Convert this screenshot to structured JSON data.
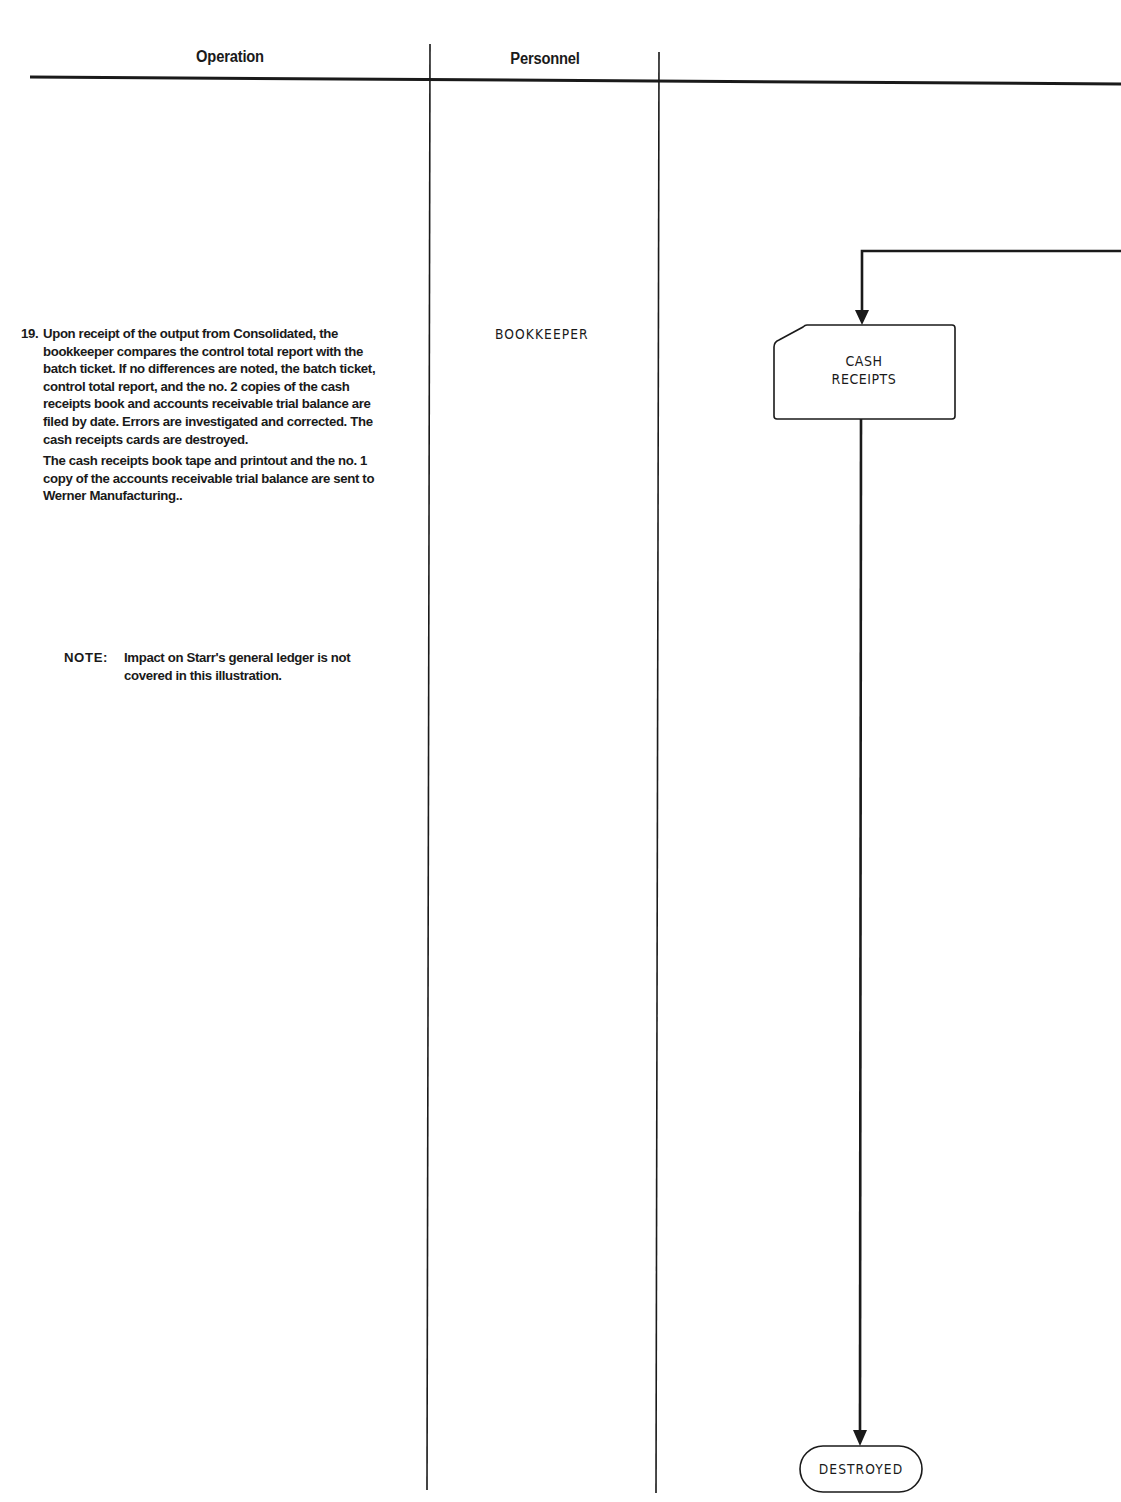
{
  "table": {
    "columns": [
      {
        "label": "Operation"
      },
      {
        "label": "Personnel"
      },
      {
        "label": ""
      }
    ]
  },
  "operation": {
    "step_number": "19.",
    "paragraphs": [
      "Upon receipt of the output from Consolidated, the bookkeeper compares the control total report with the batch ticket. If no differences are noted, the batch ticket, control total report, and the no. 2 copies of the cash receipts book and accounts receivable trial balance are filed by date.  Errors are investigated and corrected.  The cash receipts cards are destroyed.",
      "The cash receipts book tape and printout and the no. 1 copy of the accounts receivable trial balance are sent to Werner Manufacturing.."
    ],
    "note": {
      "label": "NOTE:",
      "text": "Impact on Starr's general ledger is not covered in this illustration."
    }
  },
  "personnel": {
    "role": "BOOKKEEPER"
  },
  "flowchart": {
    "nodes": [
      {
        "id": "cash-receipts",
        "shape": "punched-card",
        "label_line1": "CASH",
        "label_line2": "RECEIPTS"
      },
      {
        "id": "destroyed",
        "shape": "terminal",
        "label": "DESTROYED"
      }
    ],
    "edges": [
      {
        "from": "off-page-right",
        "to": "cash-receipts"
      },
      {
        "from": "cash-receipts",
        "to": "destroyed"
      }
    ],
    "colors": {
      "line": "#1a1a1a",
      "background": "#ffffff"
    }
  }
}
